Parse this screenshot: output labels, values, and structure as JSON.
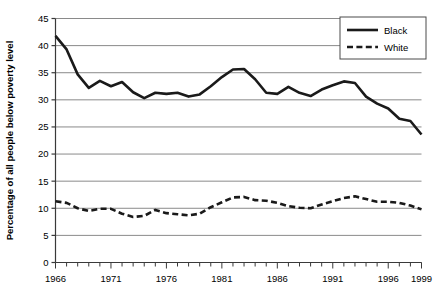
{
  "chart_data": {
    "type": "line",
    "title": "",
    "xlabel": "",
    "ylabel": "Percentage of all people below poverty level",
    "xlim": [
      1966,
      1999
    ],
    "ylim": [
      0,
      45
    ],
    "ytick_step": 5,
    "yticks": [
      "0",
      "5",
      "10",
      "15",
      "20",
      "25",
      "30",
      "35",
      "40",
      "45"
    ],
    "xticks": [
      "1966",
      "1971",
      "1976",
      "1981",
      "1986",
      "1991",
      "1996",
      "1999"
    ],
    "xtick_values": [
      1966,
      1971,
      1976,
      1981,
      1986,
      1991,
      1996,
      1999
    ],
    "minor_xticks_every": 1,
    "grid": "horizontal",
    "legend_position": "top-right",
    "x": [
      1966,
      1967,
      1968,
      1969,
      1970,
      1971,
      1972,
      1973,
      1974,
      1975,
      1976,
      1977,
      1978,
      1979,
      1980,
      1981,
      1982,
      1983,
      1984,
      1985,
      1986,
      1987,
      1988,
      1989,
      1990,
      1991,
      1992,
      1993,
      1994,
      1995,
      1996,
      1997,
      1998,
      1999
    ],
    "series": [
      {
        "name": "Black",
        "style": "solid",
        "color": "#1a1a1a",
        "values": [
          41.8,
          39.3,
          34.7,
          32.2,
          33.5,
          32.5,
          33.3,
          31.4,
          30.3,
          31.3,
          31.1,
          31.3,
          30.6,
          31.0,
          32.5,
          34.2,
          35.6,
          35.7,
          33.8,
          31.3,
          31.1,
          32.4,
          31.3,
          30.7,
          31.9,
          32.7,
          33.4,
          33.1,
          30.6,
          29.3,
          28.4,
          26.5,
          26.1,
          23.6
        ]
      },
      {
        "name": "White",
        "style": "dashed",
        "color": "#1a1a1a",
        "values": [
          11.3,
          11.0,
          10.0,
          9.5,
          9.9,
          9.9,
          9.0,
          8.4,
          8.6,
          9.7,
          9.1,
          8.9,
          8.7,
          9.0,
          10.2,
          11.1,
          12.0,
          12.1,
          11.5,
          11.4,
          11.0,
          10.4,
          10.1,
          10.0,
          10.7,
          11.3,
          11.9,
          12.2,
          11.7,
          11.2,
          11.2,
          11.0,
          10.5,
          9.8
        ]
      }
    ]
  },
  "legend": {
    "entries": [
      {
        "label": "Black",
        "style": "solid"
      },
      {
        "label": "White",
        "style": "dashed"
      }
    ]
  }
}
